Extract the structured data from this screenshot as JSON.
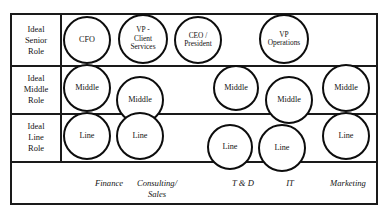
{
  "diagram": {
    "frame": {
      "x": 10,
      "y": 13,
      "width": 368,
      "height": 192
    },
    "label_column_width": 48,
    "border_color": "#1a1a1a",
    "circle_color": "#0d0d0d",
    "background_color": "#ffffff"
  },
  "row_labels": [
    {
      "name": "ideal-senior-role",
      "lines": [
        "Ideal",
        "Senior",
        "Role"
      ]
    },
    {
      "name": "ideal-middle-role",
      "lines": [
        "Ideal",
        "Middle",
        "Role"
      ]
    },
    {
      "name": "ideal-line-role",
      "lines": [
        "Ideal",
        "Line",
        "Role"
      ]
    }
  ],
  "column_labels": [
    {
      "name": "finance",
      "text": "Finance",
      "x": 80,
      "y": 178,
      "width": 58
    },
    {
      "name": "consulting-sales",
      "text": "Consulting/\nSales",
      "x": 124,
      "y": 178,
      "width": 66
    },
    {
      "name": "t-and-d",
      "text": "T & D",
      "x": 218,
      "y": 178,
      "width": 50
    },
    {
      "name": "it",
      "text": "IT",
      "x": 270,
      "y": 178,
      "width": 40
    },
    {
      "name": "marketing",
      "text": "Marketing",
      "x": 317,
      "y": 178,
      "width": 62
    }
  ],
  "nodes": [
    {
      "name": "node-finance-senior",
      "text": "CFO",
      "column": "Finance",
      "role": "Senior",
      "x": 63,
      "y": 16,
      "size": 48,
      "small": false
    },
    {
      "name": "node-consulting-senior",
      "text": "VP -\nClient\nServices",
      "column": "Consulting/Sales",
      "role": "Senior",
      "x": 118,
      "y": 14,
      "size": 50,
      "small": true
    },
    {
      "name": "node-ceo-senior",
      "text": "CEO /\nPresident",
      "column": "Consulting/Sales",
      "role": "Senior",
      "x": 174,
      "y": 16,
      "size": 48,
      "small": true
    },
    {
      "name": "node-it-senior",
      "text": "VP\nOperations",
      "column": "IT",
      "role": "Senior",
      "x": 259,
      "y": 14,
      "size": 50,
      "small": true
    },
    {
      "name": "node-finance-middle",
      "text": "Middle",
      "column": "Finance",
      "role": "Middle",
      "x": 63,
      "y": 64,
      "size": 48,
      "small": false
    },
    {
      "name": "node-consulting-middle",
      "text": "Middle",
      "column": "Consulting/Sales",
      "role": "Middle",
      "x": 116,
      "y": 76,
      "size": 48,
      "small": false
    },
    {
      "name": "node-td-middle",
      "text": "Middle",
      "column": "T & D",
      "role": "Middle",
      "x": 213,
      "y": 65,
      "size": 46,
      "small": false
    },
    {
      "name": "node-it-middle",
      "text": "Middle",
      "column": "IT",
      "role": "Middle",
      "x": 265,
      "y": 76,
      "size": 48,
      "small": false
    },
    {
      "name": "node-marketing-middle",
      "text": "Middle",
      "column": "Marketing",
      "role": "Middle",
      "x": 322,
      "y": 64,
      "size": 48,
      "small": false
    },
    {
      "name": "node-finance-line",
      "text": "Line",
      "column": "Finance",
      "role": "Line",
      "x": 63,
      "y": 112,
      "size": 48,
      "small": false
    },
    {
      "name": "node-consulting-line",
      "text": "Line",
      "column": "Consulting/Sales",
      "role": "Line",
      "x": 116,
      "y": 112,
      "size": 48,
      "small": false
    },
    {
      "name": "node-td-line",
      "text": "Line",
      "column": "T & D",
      "role": "Line",
      "x": 207,
      "y": 124,
      "size": 46,
      "small": false
    },
    {
      "name": "node-it-line",
      "text": "Line",
      "column": "IT",
      "role": "Line",
      "x": 258,
      "y": 124,
      "size": 48,
      "small": false
    },
    {
      "name": "node-marketing-line",
      "text": "Line",
      "column": "Marketing",
      "role": "Line",
      "x": 322,
      "y": 112,
      "size": 48,
      "small": false
    }
  ]
}
